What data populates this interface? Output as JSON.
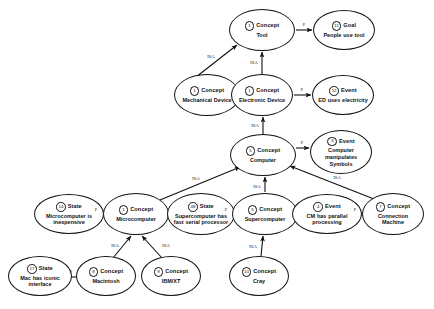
{
  "diagram": {
    "node_type_labels": {
      "concept": "Concept",
      "goal": "Goal",
      "event": "Event",
      "state": "State"
    },
    "relations": {
      "isa": "ISA",
      "property": "P"
    },
    "nodes": [
      {
        "id": "tool",
        "badge": "1",
        "type": "Concept",
        "label": "Tool",
        "cx": 262,
        "cy": 30,
        "w": 66,
        "h": 42
      },
      {
        "id": "goal_people_use_tool",
        "badge": "11",
        "type": "Goal",
        "label": "People use tool",
        "cx": 344,
        "cy": 30,
        "w": 62,
        "h": 40
      },
      {
        "id": "mechanical_device",
        "badge": "1",
        "type": "Concept",
        "label": "Mechanical Device",
        "cx": 207,
        "cy": 95,
        "w": 66,
        "h": 42
      },
      {
        "id": "electronic_device",
        "badge": "1",
        "type": "Concept",
        "label": "Electronic Device",
        "cx": 262,
        "cy": 95,
        "w": 62,
        "h": 42
      },
      {
        "id": "event_ed_uses_electricity",
        "badge": "12",
        "type": "Event",
        "label": "ED uses electricity",
        "cx": 343,
        "cy": 95,
        "w": 62,
        "h": 40
      },
      {
        "id": "computer",
        "badge": "5",
        "type": "Concept",
        "label": "Computer",
        "cx": 263,
        "cy": 155,
        "w": 66,
        "h": 42
      },
      {
        "id": "event_computer_manipulates_symbols",
        "badge": "3",
        "type": "Event",
        "label": "Computer manipulates Symbols",
        "cx": 341,
        "cy": 152,
        "w": 62,
        "h": 44
      },
      {
        "id": "state_microcomputer_inexpensive",
        "badge": "14",
        "type": "State",
        "label": "Microcomputer is inexpensive",
        "cx": 69,
        "cy": 214,
        "w": 70,
        "h": 40
      },
      {
        "id": "microcomputer",
        "badge": "1",
        "type": "Concept",
        "label": "Microcomputer",
        "cx": 136,
        "cy": 214,
        "w": 66,
        "h": 42
      },
      {
        "id": "state_supercomputer_fast_serial",
        "badge": "48",
        "type": "State",
        "label": "Supercomputer has fast serial processor",
        "cx": 201,
        "cy": 214,
        "w": 68,
        "h": 42
      },
      {
        "id": "supercomputer",
        "badge": "5",
        "type": "Concept",
        "label": "Supercomputer",
        "cx": 265,
        "cy": 214,
        "w": 66,
        "h": 42
      },
      {
        "id": "event_cm_parallel_processing",
        "badge": "4",
        "type": "Event",
        "label": "CM has parallel processing",
        "cx": 327,
        "cy": 214,
        "w": 70,
        "h": 40
      },
      {
        "id": "connection_machine",
        "badge": "7",
        "type": "Concept",
        "label": "Connection Machine",
        "cx": 393,
        "cy": 214,
        "w": 62,
        "h": 42
      },
      {
        "id": "state_mac_iconic_interface",
        "badge": "17",
        "type": "State",
        "label": "Mac has iconic interface",
        "cx": 40,
        "cy": 276,
        "w": 64,
        "h": 40
      },
      {
        "id": "macintosh",
        "badge": "8",
        "type": "Concept",
        "label": "Macintosh",
        "cx": 106,
        "cy": 276,
        "w": 60,
        "h": 40
      },
      {
        "id": "ibm_xt",
        "badge": "9",
        "type": "Concept",
        "label": "IBM/XT",
        "cx": 171,
        "cy": 276,
        "w": 60,
        "h": 40
      },
      {
        "id": "cray",
        "badge": "10",
        "type": "Concept",
        "label": "Cray",
        "cx": 259,
        "cy": 276,
        "w": 60,
        "h": 40
      }
    ],
    "edges": [
      {
        "from": "mechanical_device",
        "to": "tool",
        "label": "ISA",
        "x1": 196,
        "y1": 77,
        "x2": 237,
        "y2": 45,
        "lx": 211,
        "ly": 56
      },
      {
        "from": "electronic_device",
        "to": "tool",
        "label": "ISA",
        "x1": 262,
        "y1": 74,
        "x2": 262,
        "y2": 52,
        "lx": 254,
        "ly": 62
      },
      {
        "from": "tool",
        "to": "goal_people_use_tool",
        "label": "P",
        "x1": 296,
        "y1": 30,
        "x2": 312,
        "y2": 30,
        "lx": 304,
        "ly": 24
      },
      {
        "from": "computer",
        "to": "electronic_device",
        "label": "ISA",
        "x1": 263,
        "y1": 134,
        "x2": 263,
        "y2": 117,
        "lx": 255,
        "ly": 125
      },
      {
        "from": "electronic_device",
        "to": "event_ed_uses_electricity",
        "label": "P",
        "x1": 294,
        "y1": 95,
        "x2": 311,
        "y2": 95,
        "lx": 302,
        "ly": 89
      },
      {
        "from": "computer",
        "to": "event_computer_manipulates_symbols",
        "label": "P",
        "x1": 296,
        "y1": 148,
        "x2": 309,
        "y2": 148,
        "lx": 302,
        "ly": 142
      },
      {
        "from": "microcomputer",
        "to": "computer",
        "label": "ISA",
        "x1": 160,
        "y1": 200,
        "x2": 240,
        "y2": 167,
        "lx": 196,
        "ly": 178
      },
      {
        "from": "supercomputer",
        "to": "computer",
        "label": "ISA",
        "x1": 265,
        "y1": 192,
        "x2": 265,
        "y2": 177,
        "lx": 257,
        "ly": 186
      },
      {
        "from": "connection_machine",
        "to": "computer",
        "label": "ISA",
        "x1": 374,
        "y1": 199,
        "x2": 290,
        "y2": 166,
        "lx": 337,
        "ly": 177
      },
      {
        "from": "microcomputer",
        "to": "state_microcomputer_inexpensive",
        "label": "P",
        "x1": 103,
        "y1": 216,
        "x2": 89,
        "y2": 216,
        "lx": 96,
        "ly": 209
      },
      {
        "from": "supercomputer",
        "to": "state_supercomputer_fast_serial",
        "label": "P",
        "x1": 232,
        "y1": 215,
        "x2": 219,
        "y2": 215,
        "lx": 226,
        "ly": 209
      },
      {
        "from": "connection_machine",
        "to": "event_cm_parallel_processing",
        "label": "P",
        "x1": 362,
        "y1": 215,
        "x2": 347,
        "y2": 215,
        "lx": 355,
        "ly": 209
      },
      {
        "from": "macintosh",
        "to": "microcomputer",
        "label": "ISA",
        "x1": 113,
        "y1": 258,
        "x2": 131,
        "y2": 236,
        "lx": 115,
        "ly": 245
      },
      {
        "from": "ibm_xt",
        "to": "microcomputer",
        "label": "ISA",
        "x1": 162,
        "y1": 258,
        "x2": 142,
        "y2": 236,
        "lx": 166,
        "ly": 245
      },
      {
        "from": "cray",
        "to": "supercomputer",
        "label": "ISA",
        "x1": 261,
        "y1": 256,
        "x2": 263,
        "y2": 236,
        "lx": 253,
        "ly": 246
      },
      {
        "from": "macintosh",
        "to": "state_mac_iconic_interface",
        "label": "P",
        "x1": 77,
        "y1": 277,
        "x2": 64,
        "y2": 277,
        "lx": 71,
        "ly": 271
      }
    ]
  }
}
